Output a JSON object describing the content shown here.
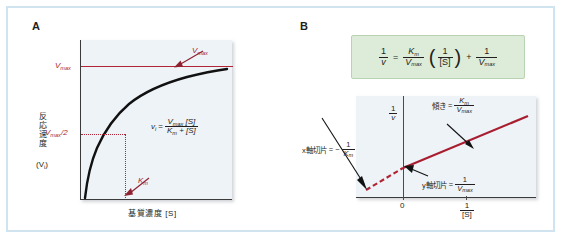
{
  "figure": {
    "border_color": "#cfe4ef",
    "plot_bg": "#eef3f8",
    "accent_red": "#b02435",
    "formula_box_bg": "#dcecd8"
  },
  "panelA": {
    "letter": "A",
    "y_axis_title": "反応速度",
    "y_axis_symbol": "(Vi)",
    "x_axis_title": "基質濃度 [S]",
    "y_tick_vmax": "Vmax",
    "y_tick_half_vmax": "Vmax/2",
    "callout_vmax": "Vmax",
    "callout_km": "Km",
    "equation": {
      "lhs": "vi",
      "eq": "=",
      "numerator": "Vmax [S]",
      "denominator": "Km + [S]"
    }
  },
  "panelB": {
    "letter": "B",
    "formula": {
      "lhs_num": "1",
      "lhs_den": "v",
      "eq": "=",
      "t1_num": "Km",
      "t1_den": "Vmax",
      "paren_open": "(",
      "t2_num": "1",
      "t2_den": "[S]",
      "paren_close": ")",
      "plus": "+",
      "t3_num": "1",
      "t3_den": "Vmax"
    },
    "y_axis_num": "1",
    "y_axis_den": "v",
    "x_axis_num": "1",
    "x_axis_den": "[S]",
    "origin_tick": "0",
    "annotations": {
      "slope_label": "傾き",
      "slope_eq": "=",
      "slope_num": "Km",
      "slope_den": "Vmax",
      "x_intercept_label": "x軸切片",
      "x_intercept_eq": "= −",
      "x_intercept_num": "1",
      "x_intercept_den": "Km",
      "y_intercept_label": "y軸切片",
      "y_intercept_eq": "=",
      "y_intercept_num": "1",
      "y_intercept_den": "Vmax"
    }
  },
  "chart_data": [
    {
      "type": "line",
      "title": "Michaelis-Menten plot",
      "xlabel": "基質濃度 [S]",
      "ylabel": "反応速度 (Vi)",
      "grid": false,
      "legend": "none",
      "annotations": [
        "Vmax",
        "Vmax/2",
        "Km"
      ],
      "series": [
        {
          "name": "v = Vmax[S]/(Km+[S])",
          "color": "#000000",
          "style": "solid",
          "x": [
            0,
            0.25,
            0.5,
            0.75,
            1,
            1.5,
            2,
            3,
            4,
            5,
            6,
            7,
            8,
            9,
            10
          ],
          "y": [
            0,
            0.2,
            0.333,
            0.429,
            0.5,
            0.6,
            0.667,
            0.75,
            0.8,
            0.833,
            0.857,
            0.875,
            0.889,
            0.9,
            0.909
          ]
        },
        {
          "name": "Vmax asymptote",
          "color": "#b02435",
          "style": "solid",
          "x": [
            0,
            10
          ],
          "y": [
            1,
            1
          ]
        }
      ],
      "xlim": [
        0,
        10
      ],
      "ylim": [
        0,
        1.15
      ]
    },
    {
      "type": "line",
      "title": "Lineweaver-Burk plot",
      "xlabel": "1/[S]",
      "ylabel": "1/v",
      "grid": false,
      "legend": "none",
      "xticks": [
        "0",
        "1/[S]"
      ],
      "annotations": [
        "傾き = Km/Vmax",
        "x軸切片 = −1/Km",
        "y軸切片 = 1/Vmax"
      ],
      "series": [
        {
          "name": "1/v = (Km/Vmax)(1/[S]) + 1/Vmax",
          "color": "#a81e31",
          "style": "solid-positive/dashed-negative",
          "x": [
            -1,
            0,
            2.8
          ],
          "y": [
            0,
            0.29,
            1.1
          ]
        }
      ],
      "xlim": [
        -1.1,
        3
      ],
      "ylim": [
        0,
        1.2
      ]
    }
  ]
}
